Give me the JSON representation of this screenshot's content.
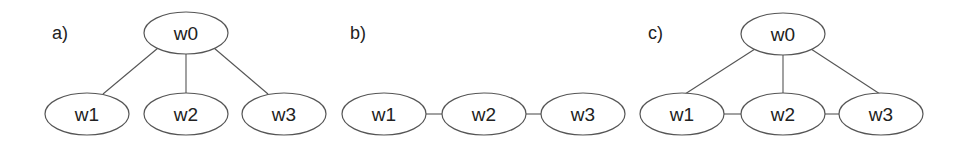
{
  "diagram": {
    "panels": [
      {
        "label": "a)",
        "structure": "star",
        "nodes": [
          {
            "id": "w0",
            "label": "w0",
            "cx": 186,
            "cy": 33
          },
          {
            "id": "w1",
            "label": "w1",
            "cx": 87,
            "cy": 114
          },
          {
            "id": "w2",
            "label": "w2",
            "cx": 186,
            "cy": 114
          },
          {
            "id": "w3",
            "label": "w3",
            "cx": 284,
            "cy": 114
          }
        ],
        "edges": [
          [
            "w0",
            "w1"
          ],
          [
            "w0",
            "w2"
          ],
          [
            "w0",
            "w3"
          ]
        ]
      },
      {
        "label": "b)",
        "structure": "chain",
        "nodes": [
          {
            "id": "w1",
            "label": "w1",
            "cx": 384,
            "cy": 114
          },
          {
            "id": "w2",
            "label": "w2",
            "cx": 484,
            "cy": 114
          },
          {
            "id": "w3",
            "label": "w3",
            "cx": 583,
            "cy": 114
          }
        ],
        "edges": [
          [
            "w1",
            "w2"
          ],
          [
            "w2",
            "w3"
          ]
        ]
      },
      {
        "label": "c)",
        "structure": "star+chain",
        "nodes": [
          {
            "id": "w0",
            "label": "w0",
            "cx": 783,
            "cy": 34
          },
          {
            "id": "w1",
            "label": "w1",
            "cx": 682,
            "cy": 114
          },
          {
            "id": "w2",
            "label": "w2",
            "cx": 783,
            "cy": 114
          },
          {
            "id": "w3",
            "label": "w3",
            "cx": 881,
            "cy": 114
          }
        ],
        "edges": [
          [
            "w0",
            "w1"
          ],
          [
            "w0",
            "w2"
          ],
          [
            "w0",
            "w3"
          ],
          [
            "w1",
            "w2"
          ],
          [
            "w2",
            "w3"
          ]
        ]
      }
    ]
  }
}
